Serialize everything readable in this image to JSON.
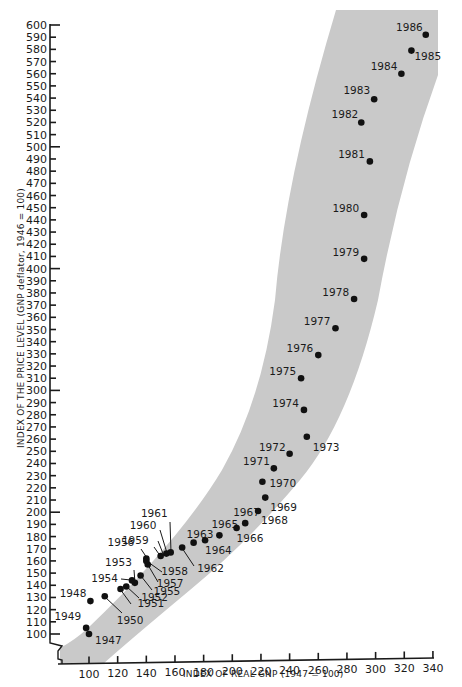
{
  "chart_data": {
    "type": "scatter",
    "title": "",
    "xlabel": "INDEX OF REAL GNP (1947 = 100)",
    "ylabel": "INDEX OF THE PRICE LEVEL (GNP deflator, 1946 = 100)",
    "xlim": [
      100,
      340
    ],
    "ylim": [
      100,
      600
    ],
    "x_ticks": [
      100,
      120,
      140,
      160,
      180,
      200,
      220,
      240,
      260,
      280,
      300,
      320,
      340
    ],
    "y_ticks": [
      100,
      110,
      120,
      130,
      140,
      150,
      160,
      170,
      180,
      190,
      200,
      210,
      220,
      230,
      240,
      250,
      260,
      270,
      280,
      290,
      300,
      310,
      320,
      330,
      340,
      350,
      360,
      370,
      380,
      390,
      400,
      410,
      420,
      430,
      440,
      450,
      460,
      470,
      480,
      490,
      500,
      510,
      520,
      530,
      540,
      550,
      560,
      570,
      580,
      590,
      600
    ],
    "grid": false,
    "axis_break": "y-axis broken below 100",
    "band": "shaded gray band indicating the trend corridor of the price level vs. real GNP path",
    "colors": {
      "band": "#c8c8c8",
      "points": "#111111",
      "axis": "#1a1a1a"
    },
    "points": [
      {
        "year": "1947",
        "x": 100,
        "y": 100
      },
      {
        "year": "1948",
        "x": 101,
        "y": 127
      },
      {
        "year": "1949",
        "x": 98,
        "y": 105
      },
      {
        "year": "1950",
        "x": 111,
        "y": 131
      },
      {
        "year": "1951",
        "x": 122,
        "y": 137
      },
      {
        "year": "1952",
        "x": 126,
        "y": 139
      },
      {
        "year": "1953",
        "x": 132,
        "y": 142
      },
      {
        "year": "1954",
        "x": 130,
        "y": 144
      },
      {
        "year": "1955",
        "x": 136,
        "y": 148
      },
      {
        "year": "1956",
        "x": 140,
        "y": 162
      },
      {
        "year": "1957",
        "x": 141,
        "y": 157
      },
      {
        "year": "1958",
        "x": 140,
        "y": 160
      },
      {
        "year": "1959",
        "x": 150,
        "y": 164
      },
      {
        "year": "1960",
        "x": 154,
        "y": 166
      },
      {
        "year": "1961",
        "x": 157,
        "y": 167
      },
      {
        "year": "1962",
        "x": 165,
        "y": 171
      },
      {
        "year": "1963",
        "x": 173,
        "y": 175
      },
      {
        "year": "1964",
        "x": 181,
        "y": 177
      },
      {
        "year": "1965",
        "x": 191,
        "y": 181
      },
      {
        "year": "1966",
        "x": 203,
        "y": 187
      },
      {
        "year": "1967",
        "x": 209,
        "y": 191
      },
      {
        "year": "1968",
        "x": 218,
        "y": 201
      },
      {
        "year": "1969",
        "x": 223,
        "y": 212
      },
      {
        "year": "1970",
        "x": 221,
        "y": 225
      },
      {
        "year": "1971",
        "x": 229,
        "y": 236
      },
      {
        "year": "1972",
        "x": 240,
        "y": 248
      },
      {
        "year": "1973",
        "x": 252,
        "y": 262
      },
      {
        "year": "1974",
        "x": 250,
        "y": 284
      },
      {
        "year": "1975",
        "x": 248,
        "y": 310
      },
      {
        "year": "1976",
        "x": 260,
        "y": 329
      },
      {
        "year": "1977",
        "x": 272,
        "y": 351
      },
      {
        "year": "1978",
        "x": 285,
        "y": 375
      },
      {
        "year": "1979",
        "x": 292,
        "y": 408
      },
      {
        "year": "1980",
        "x": 292,
        "y": 444
      },
      {
        "year": "1981",
        "x": 296,
        "y": 488
      },
      {
        "year": "1982",
        "x": 290,
        "y": 520
      },
      {
        "year": "1983",
        "x": 299,
        "y": 539
      },
      {
        "year": "1984",
        "x": 318,
        "y": 560
      },
      {
        "year": "1985",
        "x": 325,
        "y": 579
      },
      {
        "year": "1986",
        "x": 335,
        "y": 592
      }
    ]
  },
  "axes": {
    "x_title": "INDEX OF REAL GNP (1947 = 100)",
    "y_title": "INDEX OF THE PRICE LEVEL (GNP deflator, 1946 = 100)"
  },
  "ticks": {
    "x": [
      "100",
      "120",
      "140",
      "160",
      "180",
      "200",
      "220",
      "240",
      "260",
      "280",
      "300",
      "320",
      "340"
    ],
    "y": [
      "100",
      "110",
      "120",
      "130",
      "140",
      "150",
      "160",
      "170",
      "180",
      "190",
      "200",
      "210",
      "220",
      "230",
      "240",
      "250",
      "260",
      "270",
      "280",
      "290",
      "300",
      "310",
      "320",
      "330",
      "340",
      "350",
      "360",
      "370",
      "380",
      "390",
      "400",
      "410",
      "420",
      "430",
      "440",
      "450",
      "460",
      "470",
      "480",
      "490",
      "500",
      "510",
      "520",
      "530",
      "540",
      "550",
      "560",
      "570",
      "580",
      "590",
      "600"
    ]
  },
  "labels": {
    "1947": "1947",
    "1948": "1948",
    "1949": "1949",
    "1950": "1950",
    "1951": "1951",
    "1952": "1952",
    "1953": "1953",
    "1954": "1954",
    "1955": "1955",
    "1956": "1956",
    "1957": "1957",
    "1958": "1958",
    "1959": "1959",
    "1960": "1960",
    "1961": "1961",
    "1962": "1962",
    "1963": "1963",
    "1964": "1964",
    "1965": "1965",
    "1966": "1966",
    "1967": "1967",
    "1968": "1968",
    "1969": "1969",
    "1970": "1970",
    "1971": "1971",
    "1972": "1972",
    "1973": "1973",
    "1974": "1974",
    "1975": "1975",
    "1976": "1976",
    "1977": "1977",
    "1978": "1978",
    "1979": "1979",
    "1980": "1980",
    "1981": "1981",
    "1982": "1982",
    "1983": "1983",
    "1984": "1984",
    "1985": "1985",
    "1986": "1986"
  }
}
